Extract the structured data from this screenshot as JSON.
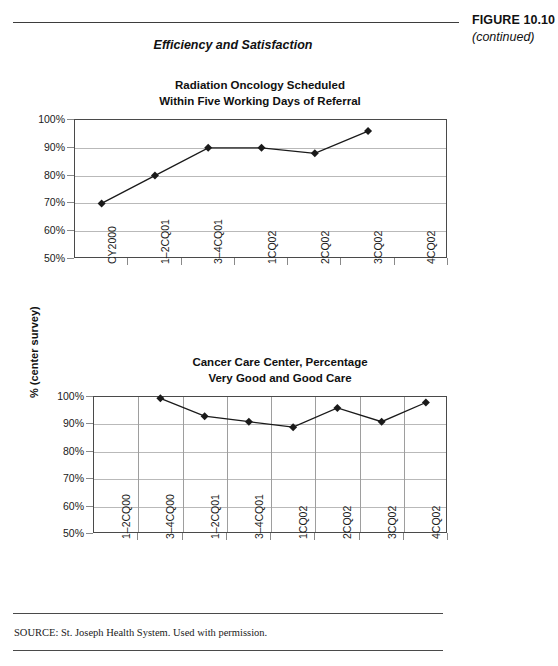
{
  "figure": {
    "label": "FIGURE 10.10",
    "continued": "(continued)"
  },
  "section_heading": "Efficiency and Satisfaction",
  "source_note": "SOURCE: St. Joseph Health System. Used with permission.",
  "chart_data": [
    {
      "type": "line",
      "title": "Radiation Oncology Scheduled\nWithin Five Working Days of Referral",
      "title_line1": "Radiation Oncology Scheduled",
      "title_line2": "Within Five Working Days of Referral",
      "xlabel": "",
      "ylabel": "",
      "categories": [
        "CY2000",
        "1–2CQ01",
        "3–4CQ01",
        "1CQ02",
        "2CQ02",
        "3CQ02",
        "4CQ02"
      ],
      "values": [
        70,
        80,
        90,
        90,
        88,
        96,
        null
      ],
      "ytick_labels": [
        "100%",
        "90%",
        "80%",
        "70%",
        "60%",
        "50%"
      ],
      "ytick_values": [
        100,
        90,
        80,
        70,
        60,
        50
      ],
      "ylim": [
        50,
        100
      ],
      "grid_horizontal": true,
      "grid_vertical": false,
      "marker": "diamond",
      "line_color": "#1a1a1a",
      "legend": null
    },
    {
      "type": "line",
      "title": "Cancer Care Center, Percentage\nVery Good and Good Care",
      "title_line1": "Cancer Care Center, Percentage",
      "title_line2": "Very Good and Good Care",
      "xlabel": "",
      "ylabel": "% (center survey)",
      "categories": [
        "1–2CQ00",
        "3–4CQ00",
        "1–2CQ01",
        "3–4CQ01",
        "1CQ02",
        "2CQ02",
        "3CQ02",
        "4CQ02"
      ],
      "values": [
        null,
        99.5,
        93,
        91,
        89,
        96,
        91,
        98
      ],
      "ytick_labels": [
        "100%",
        "90%",
        "80%",
        "70%",
        "60%",
        "50%"
      ],
      "ytick_values": [
        100,
        90,
        80,
        70,
        60,
        50
      ],
      "ylim": [
        50,
        100
      ],
      "grid_horizontal": true,
      "grid_vertical": true,
      "marker": "diamond",
      "line_color": "#1a1a1a",
      "legend": null
    }
  ]
}
